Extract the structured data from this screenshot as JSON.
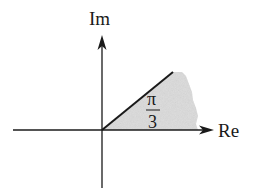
{
  "diagram": {
    "type": "complex-plane-sector",
    "axes": {
      "vertical_label": "Im",
      "horizontal_label": "Re"
    },
    "angle_label": {
      "numerator": "π",
      "denominator": "3"
    },
    "ray": {
      "angle": "π/3",
      "from": "origin"
    },
    "shaded_region": {
      "description": "sector between the positive real axis and the ray at angle π/3",
      "fill": "#dcdcdc"
    },
    "colors": {
      "axis": "#1a1a1a",
      "ray": "#1a1a1a",
      "shade": "#dcdcdc",
      "background": "#ffffff"
    }
  }
}
